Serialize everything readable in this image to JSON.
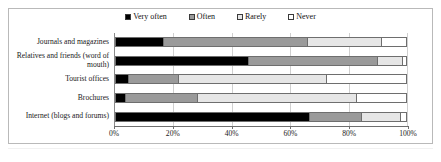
{
  "chart_data": {
    "type": "bar",
    "orientation": "horizontal",
    "stacked": true,
    "normalized_percent": true,
    "title": "",
    "xlabel": "",
    "ylabel": "",
    "xlim": [
      0,
      100
    ],
    "grid": true,
    "legend_position": "top",
    "categories": [
      "Journals and magazines",
      "Relatives and friends (word of mouth)",
      "Tourist offices",
      "Brochures",
      "Internet (blogs and forums)"
    ],
    "xticks": [
      "0%",
      "20%",
      "40%",
      "60%",
      "80%",
      "100%"
    ],
    "xtick_values": [
      0,
      20,
      40,
      60,
      80,
      100
    ],
    "series": [
      {
        "name": "Very often",
        "color": "#000000",
        "values": [
          16.7,
          45.9,
          4.8,
          3.7,
          66.9
        ]
      },
      {
        "name": "Often",
        "color": "#9a9a9a",
        "values": [
          49.3,
          44.1,
          17.2,
          24.6,
          17.6
        ]
      },
      {
        "name": "Rarely",
        "color": "#e6e6e6",
        "values": [
          25.5,
          8.5,
          50.5,
          54.7,
          13.5
        ]
      },
      {
        "name": "Never",
        "color": "#ffffff",
        "values": [
          8.5,
          1.5,
          27.5,
          17.0,
          2.0
        ]
      }
    ]
  },
  "legend": {
    "items": [
      {
        "label": "Very often",
        "color": "#000000"
      },
      {
        "label": "Often",
        "color": "#9a9a9a"
      },
      {
        "label": "Rarely",
        "color": "#e6e6e6"
      },
      {
        "label": "Never",
        "color": "#ffffff"
      }
    ]
  }
}
